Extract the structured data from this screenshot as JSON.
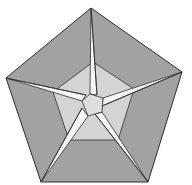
{
  "diagram": {
    "type": "origami-pentagon-star",
    "colors": {
      "background": "#ffffff",
      "outer_fill": "#a2a2a2",
      "inner_fill": "#d4d4d4",
      "center_fill": "#dedede",
      "star_fill": "#f6f6f6",
      "stroke": "#2e2e2e"
    },
    "outer_pentagon": "91,8 182,72 148,182 41,182 6,78",
    "inner_pentagon": "93,62 134,89 118,140 69,140 53,92",
    "center_pentagon": "90,94 103,98 102,112 88,116 82,101",
    "star_arms": [
      "91,8 97,95 90,94",
      "182,72 103,98 102,106",
      "148,182 95,114 102,112",
      "41,182 88,116 82,108",
      "6,78 82,101 86,95"
    ],
    "fold_lines": [
      "91,8 97,95",
      "182,72 102,106",
      "148,182 95,114",
      "41,182 82,108",
      "6,78 86,95"
    ]
  }
}
